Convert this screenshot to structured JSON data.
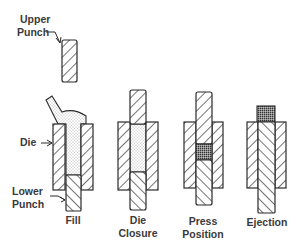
{
  "labels": {
    "upper_punch": [
      "Upper",
      "Punch"
    ],
    "die": "Die",
    "lower_punch": [
      "Lower",
      "Punch"
    ]
  },
  "stages": [
    {
      "name": "fill",
      "caption": [
        "Fill"
      ]
    },
    {
      "name": "die-closure",
      "caption": [
        "Die",
        "Closure"
      ]
    },
    {
      "name": "press-position",
      "caption": [
        "Press",
        "Position"
      ]
    },
    {
      "name": "ejection",
      "caption": [
        "Ejection"
      ]
    }
  ],
  "colors": {
    "line": "#2a2a2a",
    "powder": "#ececec",
    "compact": "#9a9a9a"
  }
}
